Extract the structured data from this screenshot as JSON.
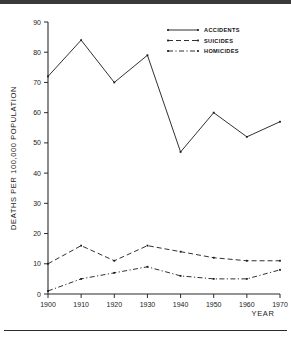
{
  "chart_data": {
    "type": "line",
    "title": "",
    "xlabel": "YEAR",
    "ylabel": "DEATHS  PER  100,000  POPULATION",
    "x": [
      1900,
      1910,
      1920,
      1930,
      1940,
      1950,
      1960,
      1970
    ],
    "xtick_labels": [
      "1900",
      "1910",
      "1920",
      "1930",
      "1940",
      "1950",
      "1960",
      "1970"
    ],
    "xlim": [
      1900,
      1970
    ],
    "ytick_labels": [
      "0",
      "10",
      "20",
      "30",
      "40",
      "50",
      "60",
      "70",
      "80",
      "90"
    ],
    "yticks": [
      0,
      10,
      20,
      30,
      40,
      50,
      60,
      70,
      80,
      90
    ],
    "ylim": [
      0,
      90
    ],
    "grid": false,
    "legend_position": "top-right",
    "series": [
      {
        "name": "ACCIDENTS",
        "style": "solid",
        "values": [
          72,
          84,
          70,
          79,
          47,
          60,
          52,
          57
        ]
      },
      {
        "name": "SUICIDES",
        "style": "dashed",
        "values": [
          10,
          16,
          11,
          16,
          14,
          12,
          11,
          11
        ]
      },
      {
        "name": "HOMICIDES",
        "style": "dash-dot",
        "values": [
          1,
          5,
          7,
          9,
          6,
          5,
          5,
          8
        ]
      }
    ]
  },
  "legend": {
    "items": [
      {
        "label": "ACCIDENTS"
      },
      {
        "label": "SUICIDES"
      },
      {
        "label": "HOMICIDES"
      }
    ]
  },
  "colors": {
    "ink": "#1a1a1a",
    "axis": "#2b2b2b",
    "background": "#ffffff",
    "top_band": "#3a3a3a"
  }
}
